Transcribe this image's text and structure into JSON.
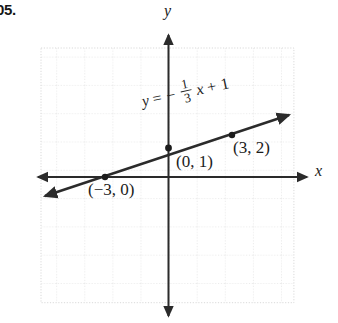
{
  "problem": {
    "number": "05."
  },
  "figure": {
    "type": "coordinate-graph",
    "axes": {
      "x_label": "x",
      "y_label": "y"
    },
    "equation": {
      "lhs": "y",
      "equals": "=",
      "minus": "−",
      "numerator": "1",
      "denominator": "3",
      "variable": "x",
      "plus": "+",
      "constant": "1",
      "plain": "y = −1/3 x + 1"
    },
    "points": [
      {
        "name": "y-intercept",
        "label": "(0, 1)",
        "x": 0,
        "y": 1
      },
      {
        "name": "point-3-2",
        "label": "(3, 2)",
        "x": 3,
        "y": 2
      },
      {
        "name": "x-intercept",
        "label": "(−3, 0)",
        "x": -3,
        "y": 0
      }
    ],
    "line": {
      "slope": 0.3333333333,
      "intercept": 1,
      "arrowheads": "both"
    },
    "grid": {
      "visible": true,
      "style": "dotted",
      "color": "#d8d8d8",
      "cell_px": 28,
      "columns": 9,
      "rows": 9
    },
    "colors": {
      "axis": "#2b2b2b",
      "line": "#2b2b2b",
      "grid": "#d8d8d8",
      "text": "#1c1c1c",
      "background": "#ffffff"
    }
  }
}
